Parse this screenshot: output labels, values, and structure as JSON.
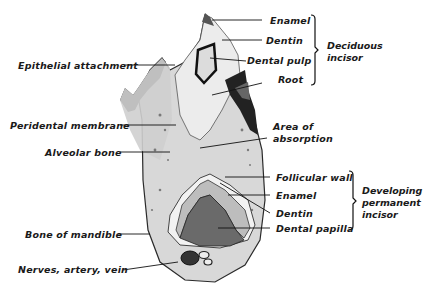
{
  "diagram": {
    "left_labels": [
      {
        "text": "Epithelial attachment",
        "x": 18,
        "y": 60
      },
      {
        "text": "Peridental membrane",
        "x": 10,
        "y": 119
      },
      {
        "text": "Alveolar bone",
        "x": 45,
        "y": 146
      },
      {
        "text": "Bone of mandible",
        "x": 25,
        "y": 227
      },
      {
        "text": "Nerves, artery, vein",
        "x": 18,
        "y": 263
      }
    ],
    "right_labels_top": [
      {
        "text": "Enamel",
        "x": 270,
        "y": 16
      },
      {
        "text": "Dentin",
        "x": 267,
        "y": 35
      },
      {
        "text": "Dental pulp",
        "x": 247,
        "y": 55
      },
      {
        "text": "Root",
        "x": 278,
        "y": 74
      }
    ],
    "right_labels_middle": [
      {
        "text": "Area of",
        "x": 273,
        "y": 122
      },
      {
        "text": "absorption",
        "x": 273,
        "y": 134
      }
    ],
    "right_labels_bottom": [
      {
        "text": "Follicular wall",
        "x": 276,
        "y": 172
      },
      {
        "text": "Enamel",
        "x": 276,
        "y": 190
      },
      {
        "text": "Dentin",
        "x": 276,
        "y": 209
      },
      {
        "text": "Dental papilla",
        "x": 276,
        "y": 223
      }
    ],
    "groups": [
      {
        "name": "Deciduous incisor",
        "line1": "Deciduous",
        "line2": "incisor"
      },
      {
        "name": "Developing permanent incisor",
        "line1": "Developing",
        "line2": "permanent",
        "line3": "incisor"
      }
    ]
  }
}
